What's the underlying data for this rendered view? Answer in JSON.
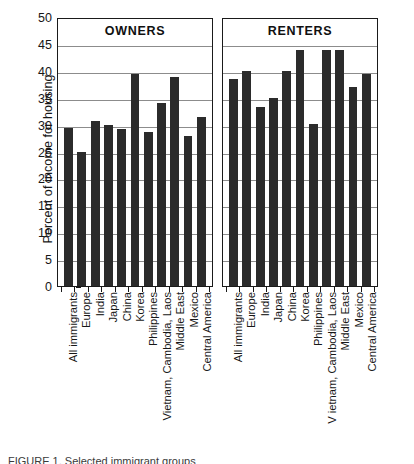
{
  "chart_data": {
    "type": "bar",
    "title": "",
    "xlabel": "",
    "ylabel": "Percent of income for housing",
    "ylim": [
      0,
      50
    ],
    "ytick_step": 5,
    "ytick_labels": [
      "50",
      "45",
      "40",
      "35",
      "30",
      "25",
      "20",
      "15",
      "10",
      "5",
      "0"
    ],
    "ytick_values": [
      50,
      45,
      40,
      35,
      30,
      25,
      20,
      15,
      10,
      5,
      0
    ],
    "grid": true,
    "legend": "none",
    "bar_color": "#2b2b2b",
    "panels": [
      {
        "name": "owners",
        "title": "OWNERS",
        "categories": [
          "All immigrants",
          "Europe",
          "India",
          "Japan",
          "China",
          "Korea",
          "Philippines",
          "Vietnam, Cambodia, Laos",
          "Middle East",
          "Mexico",
          "Central America"
        ],
        "values": [
          29.3,
          25.0,
          30.7,
          29.9,
          29.2,
          39.4,
          28.6,
          34.1,
          38.8,
          27.9,
          31.5
        ]
      },
      {
        "name": "renters",
        "title": "RENTERS",
        "categories": [
          "All immigrants",
          "Europe",
          "India",
          "Japan",
          "China",
          "Korea",
          "Philippines",
          "V ietnam, Cambodia, Laos",
          "Middle East",
          "Mexico",
          "Central America"
        ],
        "values": [
          38.4,
          39.9,
          33.3,
          35.0,
          40.0,
          43.9,
          30.1,
          43.9,
          43.9,
          37.0,
          39.4
        ]
      }
    ]
  },
  "axis": {
    "ylabel": "Percent of income for housing"
  },
  "panel_titles": {
    "owners": "OWNERS",
    "renters": "RENTERS"
  },
  "caption": {
    "text": "FIGURE 1.  Selected immigrant groups"
  }
}
